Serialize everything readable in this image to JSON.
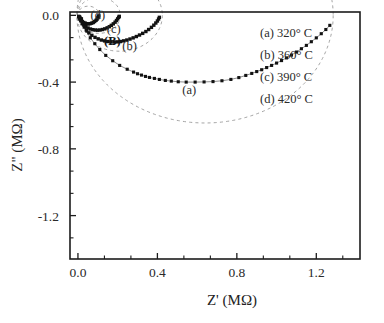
{
  "panel": {
    "label": "(B)"
  },
  "axes": {
    "x": {
      "title": "Z' (MΩ)",
      "ticks": [
        "0.0",
        "0.4",
        "0.8",
        "1.2"
      ],
      "tick_values": [
        0.0,
        0.4,
        0.8,
        1.2
      ],
      "min": -0.04,
      "max": 1.42,
      "minor_per_major": 2
    },
    "y": {
      "title": "Z\" (MΩ)",
      "ticks": [
        "0.0",
        "-0.4",
        "-0.8",
        "-1.2"
      ],
      "tick_values": [
        0.0,
        -0.4,
        -0.8,
        -1.2
      ],
      "min": -1.46,
      "max": 0.02,
      "minor_per_major": 2
    }
  },
  "legend": {
    "items": [
      {
        "key": "(a)",
        "value": "320° C",
        "text": "(a) 320° C"
      },
      {
        "key": "(b)",
        "value": "360° C",
        "text": "(b) 360° C"
      },
      {
        "key": "(c)",
        "value": "390° C",
        "text": "(c) 390° C"
      },
      {
        "key": "(d)",
        "value": "420° C",
        "text": "(d) 420° C"
      }
    ]
  },
  "curve_labels": [
    {
      "text": "(a)",
      "x": 0.56,
      "y": -0.47
    },
    {
      "text": "(b)",
      "x": 0.26,
      "y": -0.205
    },
    {
      "text": "(c)",
      "x": 0.18,
      "y": -0.105
    },
    {
      "text": "(d)",
      "x": 0.1,
      "y": -0.022
    }
  ],
  "chart_data": {
    "type": "scatter",
    "title": "(B)",
    "xlabel": "Z' (MΩ)",
    "ylabel": "Z\" (MΩ)",
    "xlim": [
      -0.04,
      1.42
    ],
    "ylim": [
      -1.46,
      0.02
    ],
    "grid": false,
    "legend_position": "top-right",
    "note": "Nyquist (complex impedance) plot; each series is a depressed semicircular arc with a dashed fitted circle",
    "series": [
      {
        "name": "(a) 320° C",
        "label": "(a)",
        "temperature_C": 320,
        "marker": "filled-square",
        "fit": {
          "type": "circle",
          "center_x": 0.64,
          "center_y": 0.0,
          "radius": 0.645,
          "depressed": true
        },
        "points": [
          [
            0.018,
            -0.02
          ],
          [
            0.03,
            -0.055
          ],
          [
            0.045,
            -0.095
          ],
          [
            0.062,
            -0.135
          ],
          [
            0.085,
            -0.17
          ],
          [
            0.11,
            -0.205
          ],
          [
            0.14,
            -0.24
          ],
          [
            0.175,
            -0.272
          ],
          [
            0.21,
            -0.3
          ],
          [
            0.248,
            -0.323
          ],
          [
            0.28,
            -0.34
          ],
          [
            0.3,
            -0.35
          ],
          [
            0.32,
            -0.358
          ],
          [
            0.34,
            -0.366
          ],
          [
            0.36,
            -0.372
          ],
          [
            0.385,
            -0.378
          ],
          [
            0.41,
            -0.384
          ],
          [
            0.44,
            -0.39
          ],
          [
            0.47,
            -0.394
          ],
          [
            0.505,
            -0.398
          ],
          [
            0.545,
            -0.4
          ],
          [
            0.59,
            -0.4
          ],
          [
            0.635,
            -0.399
          ],
          [
            0.68,
            -0.397
          ],
          [
            0.725,
            -0.392
          ],
          [
            0.77,
            -0.384
          ],
          [
            0.81,
            -0.373
          ],
          [
            0.845,
            -0.36
          ],
          [
            0.875,
            -0.348
          ],
          [
            0.9,
            -0.337
          ],
          [
            0.925,
            -0.326
          ],
          [
            0.95,
            -0.313
          ],
          [
            0.975,
            -0.3
          ],
          [
            1.0,
            -0.286
          ],
          [
            1.025,
            -0.271
          ],
          [
            1.05,
            -0.255
          ],
          [
            1.075,
            -0.238
          ],
          [
            1.1,
            -0.22
          ],
          [
            1.125,
            -0.2
          ],
          [
            1.15,
            -0.18
          ],
          [
            1.175,
            -0.158
          ],
          [
            1.2,
            -0.135
          ],
          [
            1.225,
            -0.11
          ],
          [
            1.248,
            -0.085
          ],
          [
            1.268,
            -0.06
          ]
        ]
      },
      {
        "name": "(b) 360° C",
        "label": "(b)",
        "temperature_C": 360,
        "marker": "filled-square",
        "fit": {
          "type": "circle",
          "center_x": 0.21,
          "center_y": 0.0,
          "radius": 0.215,
          "depressed": true
        },
        "points": [
          [
            0.01,
            -0.012
          ],
          [
            0.016,
            -0.03
          ],
          [
            0.023,
            -0.05
          ],
          [
            0.032,
            -0.07
          ],
          [
            0.042,
            -0.088
          ],
          [
            0.055,
            -0.105
          ],
          [
            0.07,
            -0.12
          ],
          [
            0.086,
            -0.132
          ],
          [
            0.102,
            -0.141
          ],
          [
            0.118,
            -0.148
          ],
          [
            0.134,
            -0.153
          ],
          [
            0.15,
            -0.157
          ],
          [
            0.166,
            -0.159
          ],
          [
            0.182,
            -0.16
          ],
          [
            0.198,
            -0.159
          ],
          [
            0.214,
            -0.157
          ],
          [
            0.23,
            -0.153
          ],
          [
            0.246,
            -0.148
          ],
          [
            0.262,
            -0.142
          ],
          [
            0.278,
            -0.135
          ],
          [
            0.294,
            -0.127
          ],
          [
            0.31,
            -0.118
          ],
          [
            0.326,
            -0.108
          ],
          [
            0.342,
            -0.097
          ],
          [
            0.356,
            -0.085
          ],
          [
            0.37,
            -0.072
          ],
          [
            0.382,
            -0.059
          ],
          [
            0.392,
            -0.046
          ],
          [
            0.4,
            -0.034
          ],
          [
            0.406,
            -0.022
          ],
          [
            0.41,
            -0.012
          ]
        ]
      },
      {
        "name": "(c) 390° C",
        "label": "(c)",
        "temperature_C": 390,
        "marker": "filled-square",
        "fit": {
          "type": "circle",
          "center_x": 0.105,
          "center_y": 0.0,
          "radius": 0.108,
          "depressed": true
        },
        "points": [
          [
            0.006,
            -0.008
          ],
          [
            0.01,
            -0.02
          ],
          [
            0.015,
            -0.033
          ],
          [
            0.022,
            -0.046
          ],
          [
            0.03,
            -0.058
          ],
          [
            0.04,
            -0.068
          ],
          [
            0.051,
            -0.076
          ],
          [
            0.063,
            -0.082
          ],
          [
            0.075,
            -0.086
          ],
          [
            0.087,
            -0.088
          ],
          [
            0.099,
            -0.089
          ],
          [
            0.111,
            -0.088
          ],
          [
            0.123,
            -0.085
          ],
          [
            0.135,
            -0.081
          ],
          [
            0.147,
            -0.075
          ],
          [
            0.158,
            -0.068
          ],
          [
            0.168,
            -0.06
          ],
          [
            0.178,
            -0.051
          ],
          [
            0.187,
            -0.041
          ],
          [
            0.194,
            -0.031
          ],
          [
            0.2,
            -0.021
          ],
          [
            0.205,
            -0.012
          ],
          [
            0.208,
            -0.006
          ]
        ]
      },
      {
        "name": "(d) 420° C",
        "label": "(d)",
        "temperature_C": 420,
        "marker": "filled-square",
        "fit": {
          "type": "circle",
          "center_x": 0.052,
          "center_y": 0.0,
          "radius": 0.055,
          "depressed": true
        },
        "points": [
          [
            0.004,
            -0.006
          ],
          [
            0.007,
            -0.014
          ],
          [
            0.011,
            -0.022
          ],
          [
            0.016,
            -0.03
          ],
          [
            0.022,
            -0.037
          ],
          [
            0.029,
            -0.043
          ],
          [
            0.037,
            -0.047
          ],
          [
            0.045,
            -0.05
          ],
          [
            0.053,
            -0.051
          ],
          [
            0.061,
            -0.05
          ],
          [
            0.069,
            -0.047
          ],
          [
            0.077,
            -0.043
          ],
          [
            0.084,
            -0.037
          ],
          [
            0.091,
            -0.03
          ],
          [
            0.096,
            -0.023
          ],
          [
            0.1,
            -0.015
          ],
          [
            0.103,
            -0.008
          ],
          [
            0.105,
            -0.003
          ]
        ]
      }
    ]
  }
}
